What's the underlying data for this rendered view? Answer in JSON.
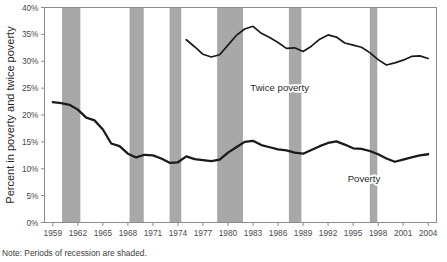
{
  "figure": {
    "note": "Note: Periods of recession are shaded.",
    "background_color": "#ffffff"
  },
  "chart_data": {
    "type": "line",
    "title": "",
    "xlabel": "",
    "ylabel": "Percent in poverty and twice poverty",
    "xlim": [
      1958,
      2005
    ],
    "ylim": [
      0,
      40
    ],
    "ytick_values": [
      0,
      5,
      10,
      15,
      20,
      25,
      30,
      35,
      40
    ],
    "ytick_labels": [
      "0%",
      "5%",
      "10%",
      "15%",
      "20%",
      "25%",
      "30%",
      "35%",
      "40%"
    ],
    "xtick_values": [
      1959,
      1962,
      1965,
      1968,
      1971,
      1974,
      1977,
      1980,
      1983,
      1986,
      1989,
      1992,
      1995,
      1998,
      2001,
      2004
    ],
    "xtick_labels": [
      "1959",
      "1962",
      "1965",
      "1968",
      "1971",
      "1974",
      "1977",
      "1980",
      "1983",
      "1986",
      "1989",
      "1992",
      "1995",
      "1998",
      "2001",
      "2004"
    ],
    "grid": false,
    "legend_position": "inline-annotation",
    "line_color": "#1a1a1a",
    "poverty_line_width": 2.3,
    "twice_poverty_line_width": 1.7,
    "shade_color": "#a8a8a8",
    "series": [
      {
        "name": "Poverty",
        "annotation_label": "Poverty",
        "annotation_x": 1996.3,
        "annotation_y": 7.6,
        "x": [
          1959,
          1960,
          1961,
          1962,
          1963,
          1964,
          1965,
          1966,
          1967,
          1968,
          1969,
          1970,
          1971,
          1972,
          1973,
          1974,
          1975,
          1976,
          1977,
          1978,
          1979,
          1980,
          1981,
          1982,
          1983,
          1984,
          1985,
          1986,
          1987,
          1988,
          1989,
          1990,
          1991,
          1992,
          1993,
          1994,
          1995,
          1996,
          1997,
          1998,
          1999,
          2000,
          2001,
          2002,
          2003,
          2004
        ],
        "values": [
          22.4,
          22.2,
          21.9,
          21.0,
          19.5,
          19.0,
          17.3,
          14.7,
          14.2,
          12.8,
          12.1,
          12.6,
          12.5,
          11.9,
          11.1,
          11.2,
          12.3,
          11.8,
          11.6,
          11.4,
          11.7,
          13.0,
          14.0,
          15.0,
          15.2,
          14.4,
          14.0,
          13.6,
          13.4,
          13.0,
          12.8,
          13.5,
          14.2,
          14.8,
          15.1,
          14.5,
          13.8,
          13.7,
          13.3,
          12.7,
          11.9,
          11.3,
          11.7,
          12.1,
          12.5,
          12.7
        ]
      },
      {
        "name": "Twice poverty",
        "annotation_label": "Twice poverty",
        "annotation_x": 1986.2,
        "annotation_y": 24.5,
        "x": [
          1975,
          1976,
          1977,
          1978,
          1979,
          1980,
          1981,
          1982,
          1983,
          1984,
          1985,
          1986,
          1987,
          1988,
          1989,
          1990,
          1991,
          1992,
          1993,
          1994,
          1995,
          1996,
          1997,
          1998,
          1999,
          2000,
          2001,
          2002,
          2003,
          2004
        ],
        "values": [
          34.0,
          32.7,
          31.3,
          30.8,
          31.2,
          33.0,
          34.8,
          36.0,
          36.5,
          35.2,
          34.4,
          33.5,
          32.4,
          32.5,
          31.8,
          32.8,
          34.1,
          34.9,
          34.5,
          33.4,
          33.0,
          32.6,
          31.6,
          30.3,
          29.3,
          29.7,
          30.2,
          30.9,
          31.0,
          30.5
        ]
      }
    ],
    "recession_bands": [
      {
        "label": "1960-61 recession",
        "start": 1960.1,
        "end": 1962.3
      },
      {
        "label": "1969-70 recession",
        "start": 1968.2,
        "end": 1969.9
      },
      {
        "label": "1973-75 recession",
        "start": 1973.0,
        "end": 1974.4
      },
      {
        "label": "1980-82 recession",
        "start": 1978.7,
        "end": 1981.8
      },
      {
        "label": "1990-91 recession",
        "start": 1987.3,
        "end": 1988.8
      },
      {
        "label": "2001 recession",
        "start": 1997.0,
        "end": 1997.9
      }
    ]
  }
}
